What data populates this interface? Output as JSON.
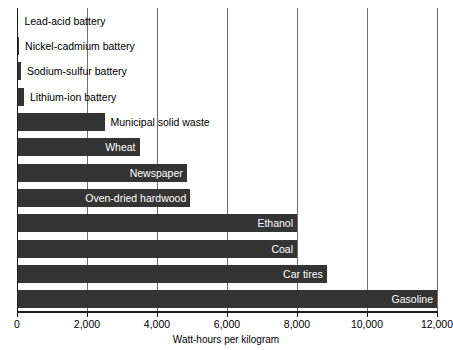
{
  "chart_data": {
    "type": "bar",
    "orientation": "horizontal",
    "title": "",
    "xlabel": "Watt-hours per kilogram",
    "ylabel": "",
    "xlim": [
      0,
      12000
    ],
    "xticks": [
      0,
      2000,
      4000,
      6000,
      8000,
      10000,
      12000
    ],
    "xtick_labels": [
      "0",
      "2,000",
      "4,000",
      "6,000",
      "8,000",
      "10,000",
      "12,000"
    ],
    "grid": true,
    "legend": "none",
    "bar_color": "#343434",
    "inside_label_color": "#ffffff",
    "outside_label_color": "#000000",
    "categories": [
      "Lead-acid battery",
      "Nickel-cadmium battery",
      "Sodium-sulfur battery",
      "Lithium-ion battery",
      "Municipal solid waste",
      "Wheat",
      "Newspaper",
      "Oven-dried hardwood",
      "Ethanol",
      "Coal",
      "Car tires",
      "Gasoline"
    ],
    "values": [
      40,
      60,
      115,
      200,
      2500,
      3500,
      4850,
      4950,
      8000,
      8000,
      8850,
      12000
    ],
    "bars": [
      {
        "label": "Lead-acid battery",
        "value": 40,
        "label_position": "outside"
      },
      {
        "label": "Nickel-cadmium battery",
        "value": 60,
        "label_position": "outside"
      },
      {
        "label": "Sodium-sulfur battery",
        "value": 115,
        "label_position": "outside"
      },
      {
        "label": "Lithium-ion battery",
        "value": 200,
        "label_position": "outside"
      },
      {
        "label": "Municipal solid waste",
        "value": 2500,
        "label_position": "outside"
      },
      {
        "label": "Wheat",
        "value": 3500,
        "label_position": "inside"
      },
      {
        "label": "Newspaper",
        "value": 4850,
        "label_position": "inside"
      },
      {
        "label": "Oven-dried hardwood",
        "value": 4950,
        "label_position": "inside"
      },
      {
        "label": "Ethanol",
        "value": 8000,
        "label_position": "inside"
      },
      {
        "label": "Coal",
        "value": 8000,
        "label_position": "inside"
      },
      {
        "label": "Car tires",
        "value": 8850,
        "label_position": "inside"
      },
      {
        "label": "Gasoline",
        "value": 12000,
        "label_position": "inside"
      }
    ]
  }
}
